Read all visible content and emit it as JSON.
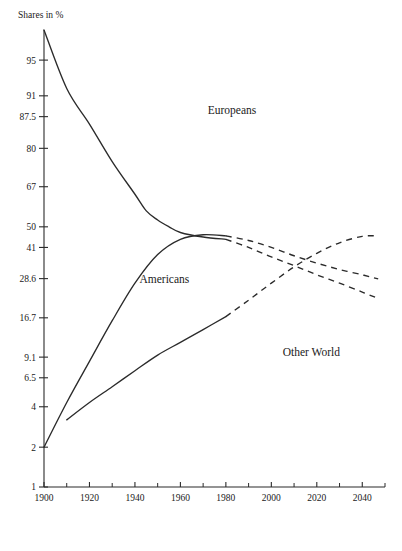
{
  "chart_data": {
    "type": "line",
    "title": "",
    "ylabel": "Shares in %",
    "xlabel": "",
    "grid": false,
    "legend_position": "inline-labels",
    "y_scale": "logit",
    "ylim": [
      1,
      97
    ],
    "xlim": [
      1900,
      2050
    ],
    "y_ticks": [
      {
        "value": 95,
        "label": "95"
      },
      {
        "value": 91,
        "label": "91"
      },
      {
        "value": 87.5,
        "label": "87.5"
      },
      {
        "value": 80,
        "label": "80"
      },
      {
        "value": 67,
        "label": "67"
      },
      {
        "value": 50,
        "label": "50"
      },
      {
        "value": 41,
        "label": "41"
      },
      {
        "value": 28.6,
        "label": "28.6"
      },
      {
        "value": 16.7,
        "label": "16.7"
      },
      {
        "value": 9.1,
        "label": "9.1"
      },
      {
        "value": 6.5,
        "label": "6.5"
      },
      {
        "value": 4,
        "label": "4"
      },
      {
        "value": 2,
        "label": "2"
      },
      {
        "value": 1,
        "label": "1"
      }
    ],
    "x_ticks_major": [
      {
        "value": 1900,
        "label": "1900"
      },
      {
        "value": 1920,
        "label": "1920"
      },
      {
        "value": 1940,
        "label": "1940"
      },
      {
        "value": 1960,
        "label": "1960"
      },
      {
        "value": 1980,
        "label": "1980"
      },
      {
        "value": 2000,
        "label": "2000"
      },
      {
        "value": 2020,
        "label": "2020"
      },
      {
        "value": 2040,
        "label": "2040"
      }
    ],
    "x_ticks_minor": [
      1910,
      1930,
      1950,
      1970,
      1990,
      2010,
      2030,
      2050
    ],
    "series": [
      {
        "name": "Europeans",
        "label": "Europeans",
        "style": "solid-then-dashed",
        "color": "#2b2b2b",
        "label_x": 1972,
        "label_y": 88,
        "observed": [
          {
            "x": 1900,
            "y": 97.0
          },
          {
            "x": 1910,
            "y": 92.0
          },
          {
            "x": 1920,
            "y": 86.0
          },
          {
            "x": 1930,
            "y": 76.0
          },
          {
            "x": 1940,
            "y": 64.0
          },
          {
            "x": 1945,
            "y": 57.0
          },
          {
            "x": 1950,
            "y": 53.0
          },
          {
            "x": 1955,
            "y": 50.0
          },
          {
            "x": 1960,
            "y": 47.5
          },
          {
            "x": 1970,
            "y": 45.5
          },
          {
            "x": 1980,
            "y": 44.5
          }
        ],
        "projected": [
          {
            "x": 1980,
            "y": 44.5
          },
          {
            "x": 1990,
            "y": 41.0
          },
          {
            "x": 2000,
            "y": 37.0
          },
          {
            "x": 2010,
            "y": 33.5
          },
          {
            "x": 2020,
            "y": 30.0
          },
          {
            "x": 2030,
            "y": 27.0
          },
          {
            "x": 2040,
            "y": 24.0
          },
          {
            "x": 2047,
            "y": 22.0
          }
        ]
      },
      {
        "name": "Americans",
        "label": "Americans",
        "style": "solid-then-dashed",
        "color": "#2b2b2b",
        "label_x": 1942,
        "label_y": 27,
        "observed": [
          {
            "x": 1900,
            "y": 2.0
          },
          {
            "x": 1910,
            "y": 4.3
          },
          {
            "x": 1920,
            "y": 8.5
          },
          {
            "x": 1930,
            "y": 16.0
          },
          {
            "x": 1940,
            "y": 27.0
          },
          {
            "x": 1950,
            "y": 38.0
          },
          {
            "x": 1960,
            "y": 44.5
          },
          {
            "x": 1970,
            "y": 46.5
          },
          {
            "x": 1980,
            "y": 46.0
          }
        ],
        "projected": [
          {
            "x": 1980,
            "y": 46.0
          },
          {
            "x": 1990,
            "y": 44.0
          },
          {
            "x": 2000,
            "y": 41.0
          },
          {
            "x": 2010,
            "y": 37.5
          },
          {
            "x": 2020,
            "y": 34.5
          },
          {
            "x": 2030,
            "y": 32.0
          },
          {
            "x": 2040,
            "y": 30.0
          },
          {
            "x": 2047,
            "y": 28.5
          }
        ]
      },
      {
        "name": "Other World",
        "label": "Other World",
        "style": "solid-then-dashed",
        "color": "#2b2b2b",
        "label_x": 2005,
        "label_y": 9.2,
        "observed": [
          {
            "x": 1910,
            "y": 3.2
          },
          {
            "x": 1920,
            "y": 4.3
          },
          {
            "x": 1930,
            "y": 5.6
          },
          {
            "x": 1940,
            "y": 7.3
          },
          {
            "x": 1950,
            "y": 9.4
          },
          {
            "x": 1960,
            "y": 11.5
          },
          {
            "x": 1970,
            "y": 14.0
          },
          {
            "x": 1980,
            "y": 17.0
          }
        ],
        "projected": [
          {
            "x": 1980,
            "y": 17.0
          },
          {
            "x": 1990,
            "y": 21.5
          },
          {
            "x": 2000,
            "y": 27.0
          },
          {
            "x": 2010,
            "y": 33.0
          },
          {
            "x": 2020,
            "y": 38.5
          },
          {
            "x": 2030,
            "y": 43.0
          },
          {
            "x": 2040,
            "y": 45.8
          },
          {
            "x": 2047,
            "y": 46.0
          }
        ]
      }
    ]
  }
}
